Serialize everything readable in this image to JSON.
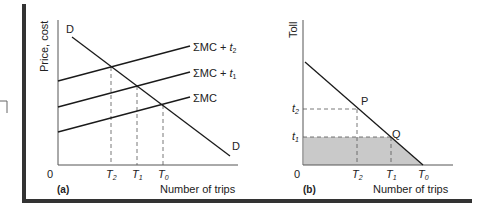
{
  "figure": {
    "panel_a": {
      "tag": "(a)",
      "ylabel": "Price, cost",
      "xlabel": "Number of trips",
      "origin": "0",
      "curves": {
        "demand_start": "D",
        "demand_end": "D",
        "mc_t2": {
          "base": "ΣMC + ",
          "var": "t",
          "sub": "2"
        },
        "mc_t1": {
          "base": "ΣMC + ",
          "var": "t",
          "sub": "1"
        },
        "mc": {
          "base": "ΣMC"
        }
      },
      "ticks": [
        {
          "var": "T",
          "sub": "2"
        },
        {
          "var": "T",
          "sub": "1"
        },
        {
          "var": "T",
          "sub": "0"
        }
      ]
    },
    "panel_b": {
      "tag": "(b)",
      "ylabel": "Toll",
      "xlabel": "Number of trips",
      "origin": "0",
      "points": {
        "p": "P",
        "q": "Q"
      },
      "yticks": [
        {
          "var": "t",
          "sub": "2"
        },
        {
          "var": "t",
          "sub": "1"
        }
      ],
      "ticks": [
        {
          "var": "T",
          "sub": "2"
        },
        {
          "var": "T",
          "sub": "1"
        },
        {
          "var": "T",
          "sub": "0"
        }
      ]
    },
    "colors": {
      "line": "#1a1a1a",
      "axis": "#555555",
      "border": "#333333",
      "shade": "#c9c9c9"
    }
  }
}
